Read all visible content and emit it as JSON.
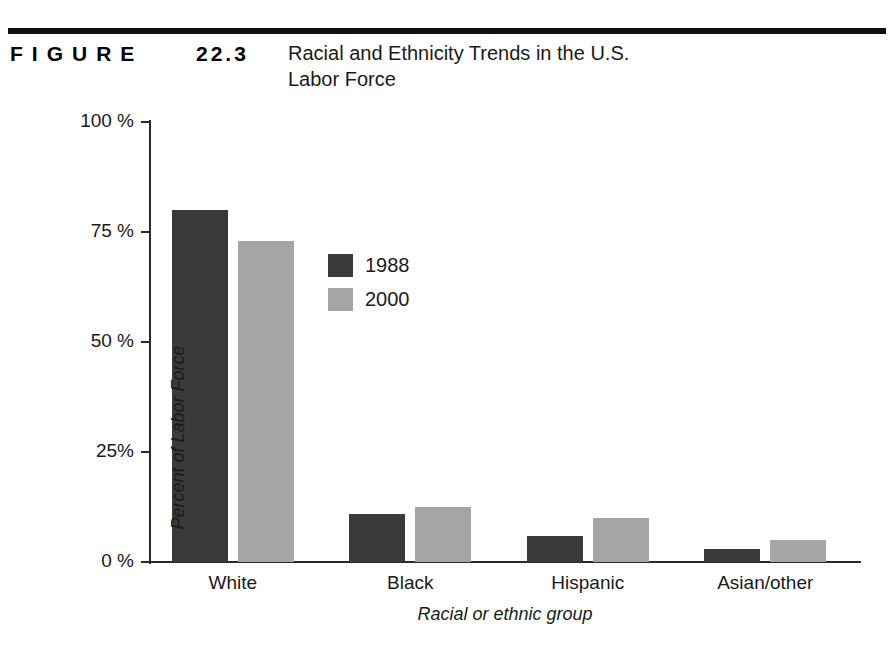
{
  "header": {
    "figure_label": "FIGURE",
    "figure_number": "22.3",
    "title_line_1": "Racial and Ethnicity Trends in the U.S.",
    "title_line_2": "Labor Force"
  },
  "colors": {
    "series_1988": "#3a3a3a",
    "series_2000": "#a5a5a5",
    "axis": "#2a2a2a",
    "rule": "#111111"
  },
  "chart_data": {
    "type": "bar",
    "title": "Racial and Ethnicity Trends in the U.S. Labor Force",
    "xlabel": "Racial or ethnic group",
    "ylabel": "Percent of Labor Force",
    "categories": [
      "White",
      "Black",
      "Hispanic",
      "Asian/other"
    ],
    "series": [
      {
        "name": "1988",
        "color": "#3a3a3a",
        "values": [
          80,
          11,
          6,
          3
        ]
      },
      {
        "name": "2000",
        "color": "#a5a5a5",
        "values": [
          73,
          12.5,
          10,
          5
        ]
      }
    ],
    "ylim": [
      0,
      100
    ],
    "yticks": [
      0,
      25,
      50,
      75,
      100
    ],
    "ytick_labels": [
      "0 %",
      "25%",
      "50 %",
      "75 %",
      "100 %"
    ],
    "grid": false,
    "legend_position": "upper-left-inside"
  }
}
